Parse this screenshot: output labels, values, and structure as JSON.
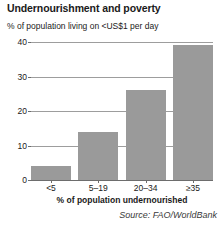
{
  "chart_data": {
    "type": "bar",
    "title": "Undernourishment and poverty",
    "subtitle": "% of population living on <US$1 per day",
    "categories": [
      "<5",
      "5–19",
      "20–34",
      "≥35"
    ],
    "values": [
      4,
      14,
      26,
      39
    ],
    "series": [
      {
        "name": "% of population living on <US$1 per day",
        "values": [
          4,
          14,
          26,
          39
        ]
      }
    ],
    "xlabel": "% of population undernourished",
    "ylabel": "% of population living on <US$1 per day",
    "ylim": [
      0,
      40
    ],
    "yticks": [
      0,
      10,
      20,
      30,
      40
    ],
    "ytick_labels": [
      "0",
      "10",
      "20",
      "30",
      "40"
    ],
    "grid": true,
    "legend": "none",
    "bar_color": "#9a9a9a",
    "gridline_color": "#9d9d9d",
    "axis_color": "#6d6d6d",
    "source": "Source: FAO/WorldBank"
  }
}
